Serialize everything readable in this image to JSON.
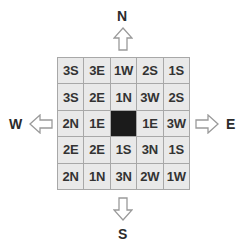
{
  "compass": {
    "north": "N",
    "south": "S",
    "east": "E",
    "west": "W"
  },
  "colors": {
    "cell_bg": "#e9e9e9",
    "cell_border": "#a8a8a8",
    "goal_cell": "#1b1b1b",
    "text": "#333333",
    "arrow_stroke": "#9a9a9a"
  },
  "grid": {
    "rows": [
      [
        "3S",
        "3E",
        "1W",
        "2S",
        "1S"
      ],
      [
        "3S",
        "2E",
        "1N",
        "3W",
        "2S"
      ],
      [
        "2N",
        "1E",
        "",
        "1E",
        "3W"
      ],
      [
        "2E",
        "2E",
        "1S",
        "3N",
        "1S"
      ],
      [
        "2N",
        "1N",
        "3N",
        "2W",
        "1W"
      ]
    ],
    "goal": {
      "row": 2,
      "col": 2
    }
  }
}
